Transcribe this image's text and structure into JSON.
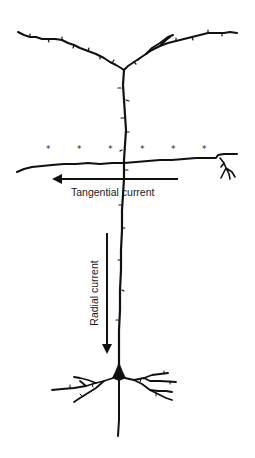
{
  "diagram": {
    "colors": {
      "ink": "#111111",
      "text": "#1a1a1a",
      "background": "#ffffff"
    },
    "markers": {
      "symbol": "*",
      "count": 6
    },
    "labels": {
      "tangential": "Tangential current",
      "radial": "Radial current"
    },
    "arrows": {
      "tangential": {
        "direction": "left"
      },
      "radial": {
        "direction": "down"
      }
    }
  }
}
